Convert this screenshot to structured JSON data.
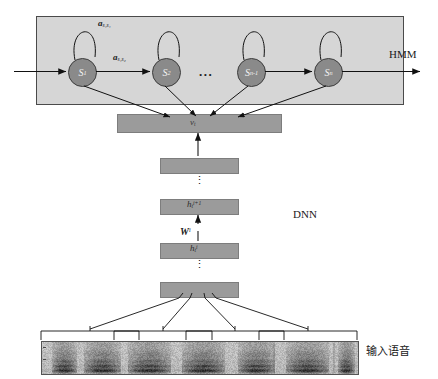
{
  "diagram": {
    "hmm": {
      "section_label": "HMM",
      "states": [
        {
          "id": "s1",
          "label": "S",
          "subscript": "1"
        },
        {
          "id": "s2",
          "label": "S",
          "subscript": "2"
        },
        {
          "id": "sn_1",
          "label": "S",
          "subscript": "n-1"
        },
        {
          "id": "sn",
          "label": "S",
          "subscript": "n"
        }
      ],
      "state_ellipsis": "...",
      "transitions": [
        {
          "name": "self-loop-s1",
          "label": "a",
          "subscript": "s₁s₁"
        },
        {
          "name": "s1-to-s2",
          "label": "a",
          "subscript": "s₁s₂"
        }
      ],
      "box_fill": "#d6d6d6",
      "state_fill": "#8a8a8a"
    },
    "dnn": {
      "section_label": "DNN",
      "layers": [
        {
          "name": "output-layer",
          "label": "v",
          "subscript": "t"
        },
        {
          "name": "upper-hidden-layer",
          "label": "",
          "subscript": ""
        },
        {
          "name": "hidden-layer-i-plus-1",
          "label": "h",
          "subscript": "t",
          "superscript": "i+1"
        },
        {
          "name": "hidden-layer-i",
          "label": "h",
          "subscript": "t",
          "superscript": "i"
        },
        {
          "name": "input-layer",
          "label": "",
          "subscript": ""
        }
      ],
      "weight": {
        "label": "W",
        "superscript": "i"
      },
      "vertical_ellipsis": "⋮",
      "bar_fill": "#9b9b9b"
    },
    "input": {
      "label": "输入语音",
      "frame_groups": 4,
      "spectrogram_name": "speech-spectrogram"
    }
  }
}
